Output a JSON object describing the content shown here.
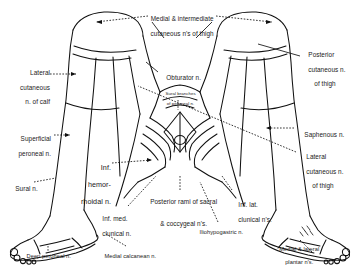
{
  "figure": {
    "type": "anatomical-line-diagram",
    "ink_color": "#111111",
    "background_color": "#ffffff"
  },
  "labels": [
    {
      "id": "medial-intermediate-cutaneous-thigh",
      "line1": "Medial & intermediate",
      "line2": "cutaneous n's of thigh"
    },
    {
      "id": "lateral-cutaneous-calf",
      "line1": "Lateral",
      "line2": "cutaneous",
      "line3": "n. of calf"
    },
    {
      "id": "obturator",
      "line1": "Obturator n."
    },
    {
      "id": "sural-branches-peroneal",
      "line1": "Sural branches",
      "line2": "of peroneal n."
    },
    {
      "id": "posterior-cutaneous-thigh",
      "line1": "Posterior",
      "line2": "cutaneous n.",
      "line3": "of thigh"
    },
    {
      "id": "saphenous",
      "line1": "Saphenous n."
    },
    {
      "id": "lateral-cutaneous-thigh",
      "line1": "Lateral",
      "line2": "cutaneous n.",
      "line3": "of thigh"
    },
    {
      "id": "superficial-peroneal",
      "line1": "Superficial",
      "line2": "peroneal n."
    },
    {
      "id": "inferior-hemorrhoidal",
      "line1": "Inf.",
      "line2": "hemor-",
      "line3": "rhoidal n."
    },
    {
      "id": "sural",
      "line1": "Sural n."
    },
    {
      "id": "posterior-rami-sacral-coccygeal",
      "line1": "Posterior rami of sacral",
      "line2": "& coccygeal n's."
    },
    {
      "id": "inferior-medial-clunical",
      "line1": "Inf. med.",
      "line2": "clunical n."
    },
    {
      "id": "inferior-lateral-clunical",
      "line1": "Inf. lat.",
      "line2": "clunical n's."
    },
    {
      "id": "iliohypogastric",
      "line1": "Iliohypogastric n."
    },
    {
      "id": "deep-peroneal",
      "line1": "Deep peroneal n."
    },
    {
      "id": "medial-calcanean",
      "line1": "Medial calcanean n."
    },
    {
      "id": "medial-lateral-plantar",
      "line1": "Medial & lateral",
      "line2": "plantar n's."
    }
  ]
}
